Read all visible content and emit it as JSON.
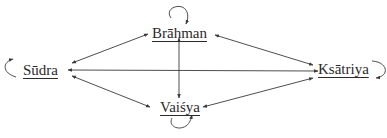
{
  "diagram": {
    "type": "relationship-graph",
    "nodes": [
      {
        "id": "brahman",
        "label": "Brāhman",
        "self_loop": true
      },
      {
        "id": "sudra",
        "label": "Sūdra",
        "self_loop": true
      },
      {
        "id": "ksatriya",
        "label": "Ksātriya",
        "self_loop": true
      },
      {
        "id": "vaisya",
        "label": "Vaiśya",
        "self_loop": true
      }
    ],
    "edges": [
      {
        "from": "sudra",
        "to": "brahman",
        "direction": "both"
      },
      {
        "from": "sudra",
        "to": "ksatriya",
        "direction": "both"
      },
      {
        "from": "sudra",
        "to": "vaisya",
        "direction": "both"
      },
      {
        "from": "brahman",
        "to": "ksatriya",
        "direction": "both"
      },
      {
        "from": "brahman",
        "to": "vaisya",
        "direction": "both"
      },
      {
        "from": "vaisya",
        "to": "ksatriya",
        "direction": "both"
      }
    ],
    "colors": {
      "line": "#3a3a3a",
      "text": "#2a2a2a",
      "background": "#ffffff"
    }
  }
}
